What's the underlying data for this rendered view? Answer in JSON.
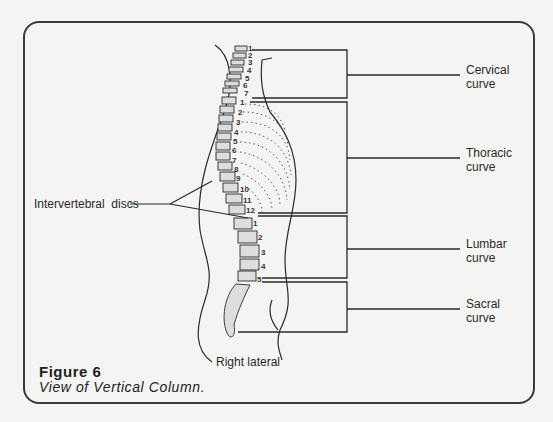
{
  "figure": {
    "title": "Figure 6",
    "caption": "View of Vertical Column.",
    "view_label": "Right lateral"
  },
  "labels": {
    "cervical": {
      "line1": "Cervical",
      "line2": "curve"
    },
    "thoracic": {
      "line1": "Thoracic",
      "line2": "curve"
    },
    "lumbar": {
      "line1": "Lumbar",
      "line2": "curve"
    },
    "sacral": {
      "line1": "Sacral",
      "line2": "curve"
    },
    "discs": "Intervertebral  discs"
  },
  "vertebrae": {
    "cervical": [
      "1",
      "2",
      "3",
      "4",
      "5",
      "6",
      "7"
    ],
    "thoracic": [
      "1",
      "2",
      "3",
      "4",
      "5",
      "6",
      "7",
      "8",
      "9",
      "10",
      "11",
      "12"
    ],
    "lumbar": [
      "1",
      "2",
      "3",
      "4",
      "5"
    ]
  },
  "colors": {
    "background": "#f4f4f2",
    "ink": "#2a2a2a"
  }
}
